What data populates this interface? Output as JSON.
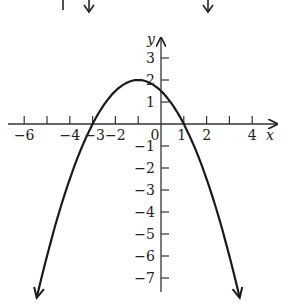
{
  "chart_data": {
    "type": "line",
    "title": "",
    "xlabel": "x",
    "ylabel": "y",
    "function": "y = -0.5(x + 1)^2 + 2",
    "vertex": [
      -1,
      2
    ],
    "x_intercepts": [
      -3,
      1
    ],
    "y_intercept": 1.5,
    "x_ticks": [
      -6,
      -5,
      -4,
      -3,
      -2,
      -1,
      0,
      1,
      2,
      3,
      4
    ],
    "x_tick_labels": [
      "−6",
      "−4",
      "−3",
      "−2",
      "0",
      "1",
      "2",
      "4"
    ],
    "y_ticks": [
      3,
      2,
      1,
      -1,
      -2,
      -3,
      -4,
      -5,
      -6,
      -7
    ],
    "y_tick_labels": [
      "3",
      "2",
      "1",
      "−1",
      "−2",
      "−3",
      "−4",
      "−5",
      "−6",
      "−7"
    ],
    "xlim": [
      -6.5,
      5
    ],
    "ylim": [
      -8,
      3.5
    ],
    "grid": false,
    "curve_color": "#1a1a1a",
    "axis_color": "#333333"
  },
  "labels": {
    "x_axis": "x",
    "y_axis": "y"
  }
}
